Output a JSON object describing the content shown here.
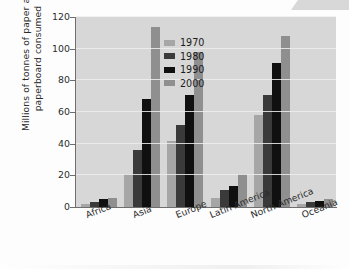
{
  "chart_data": {
    "type": "bar",
    "title": "",
    "xlabel": "",
    "ylabel": "Millions of tonnes of paper and paperboard consumed",
    "categories": [
      "Africa",
      "Asia",
      "Europe",
      "Latin America",
      "North America",
      "Oceania"
    ],
    "series": [
      {
        "name": "1970",
        "color": "#a6a6a6",
        "values": [
          2,
          21,
          42,
          6,
          58,
          2
        ]
      },
      {
        "name": "1980",
        "color": "#3a3a3a",
        "values": [
          3,
          36,
          52,
          11,
          71,
          3
        ]
      },
      {
        "name": "1990",
        "color": "#101010",
        "values": [
          5,
          68,
          71,
          13,
          91,
          4
        ]
      },
      {
        "name": "2000",
        "color": "#8f8f8f",
        "values": [
          5.5,
          114,
          98,
          21,
          108,
          5
        ]
      }
    ],
    "ylim": [
      0,
      120
    ],
    "yticks": [
      0,
      20,
      40,
      60,
      80,
      100,
      120
    ],
    "ytick_labels": [
      "0",
      "20",
      "40",
      "60",
      "80",
      "100",
      "120"
    ],
    "grid": true,
    "grid_axis": "y",
    "legend_position": "top-left",
    "plot_background": "#d7d7d7"
  }
}
